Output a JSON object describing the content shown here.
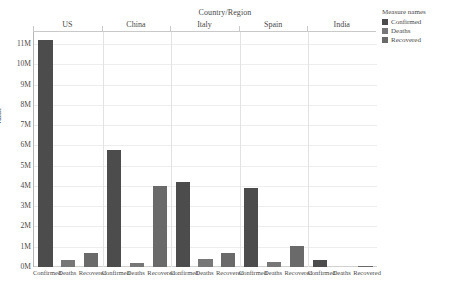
{
  "chart_data": {
    "type": "bar",
    "title": "",
    "xlabel": "Country/Region",
    "ylabel": "Value",
    "ylim": [
      0,
      11600000
    ],
    "yticks": [
      "0M",
      "1M",
      "2M",
      "3M",
      "4M",
      "5M",
      "6M",
      "7M",
      "8M",
      "9M",
      "10M",
      "11M"
    ],
    "ytick_values": [
      0,
      1000000,
      2000000,
      3000000,
      4000000,
      5000000,
      6000000,
      7000000,
      8000000,
      9000000,
      10000000,
      11000000
    ],
    "grid": true,
    "legend_position": "right",
    "panels": [
      "US",
      "China",
      "Italy",
      "Spain",
      "India"
    ],
    "categories": [
      "Confirmed",
      "Deaths",
      "Recovered"
    ],
    "series": [
      {
        "name": "US",
        "values": [
          11200000,
          350000,
          700000
        ]
      },
      {
        "name": "China",
        "values": [
          5800000,
          220000,
          4000000
        ]
      },
      {
        "name": "Italy",
        "values": [
          4200000,
          400000,
          700000
        ]
      },
      {
        "name": "Spain",
        "values": [
          3900000,
          250000,
          1050000
        ]
      },
      {
        "name": "India",
        "values": [
          350000,
          0,
          60000
        ]
      }
    ],
    "legend": [
      {
        "label": "Confirmed",
        "color": "#4c4c4c"
      },
      {
        "label": "Deaths",
        "color": "#777777"
      },
      {
        "label": "Recovered",
        "color": "#6a6a6a"
      }
    ],
    "legend_title": "Measure names"
  },
  "header": {
    "group_title": "Country/Region"
  }
}
